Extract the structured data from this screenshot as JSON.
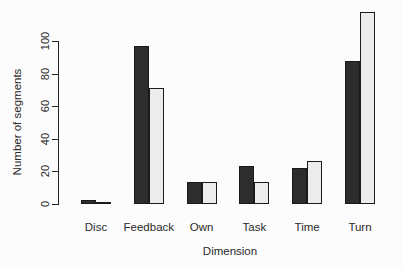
{
  "chart_data": {
    "type": "bar",
    "title": "",
    "xlabel": "Dimension",
    "ylabel": "Number of segments",
    "categories": [
      "Disc",
      "Feedback",
      "Own",
      "Task",
      "Time",
      "Turn"
    ],
    "series": [
      {
        "name": "series-1-dark",
        "color": "#2d2d2d",
        "values": [
          2,
          97,
          13,
          23,
          22,
          88
        ]
      },
      {
        "name": "series-2-light",
        "color": "#ececec",
        "values": [
          1,
          71,
          13,
          13,
          26,
          118
        ]
      }
    ],
    "yticks": [
      0,
      20,
      40,
      60,
      80,
      100
    ],
    "ylim": [
      0,
      120
    ],
    "grid": false,
    "legend": "none",
    "bar_border_color": "#1a1a1a",
    "axis_color": "#222222"
  }
}
